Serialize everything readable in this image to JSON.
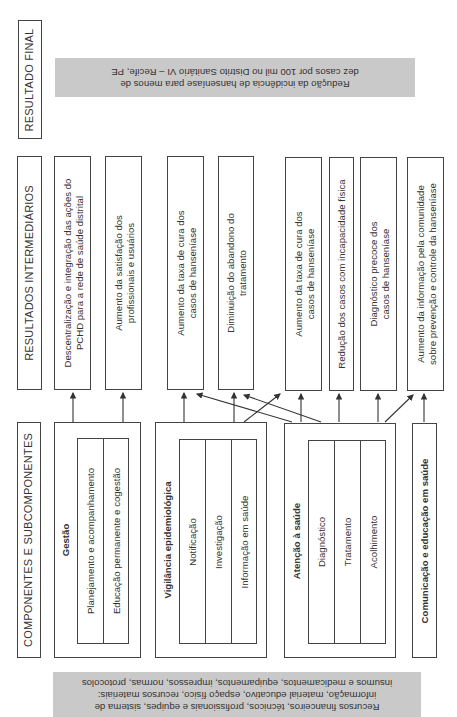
{
  "headers": {
    "final": "RESULTADO FINAL",
    "intermediate": "RESULTADOS INTERMEDIÁRIOS",
    "components": "COMPONENTES E SUBCOMPONENTES"
  },
  "final_result": {
    "line1": "Redução da incidência de hanseníase para menos de",
    "line2": "dez casos por 100 mil no Distrito Sanitário VI – Recife, PE"
  },
  "intermediate_results": [
    {
      "line1": "Descentralização e integração das ações do",
      "line2": "PCHD para a rede de saúde distrital"
    },
    {
      "line1": "Aumento da satisfação dos",
      "line2": "profissionais e usuários"
    },
    {
      "line1": "Aumento da taxa de cura dos",
      "line2": "casos de hanseníase"
    },
    {
      "line1": "Diminuição do abandono do",
      "line2": "tratamento"
    },
    {
      "line1": "Aumento da taxa de cura dos",
      "line2": "casos de hanseníase"
    },
    {
      "line1": "Redução dos casos com incapacidade física",
      "line2": ""
    },
    {
      "line1": "Diagnóstico precoce dos",
      "line2": "casos de hanseníase"
    },
    {
      "line1": "Aumento da informação pela comunidade",
      "line2": "sobre prevenção e controle da hanseníase"
    }
  ],
  "components": [
    {
      "title": "Gestão",
      "subcomponents": [
        "Planejamento e acompanhamento",
        "Educação permanente e cogestão"
      ]
    },
    {
      "title": "Vigilância epidemiológica",
      "subcomponents": [
        "Notificação",
        "Investigação",
        "Informação em saúde"
      ]
    },
    {
      "title": "Atenção à saúde",
      "subcomponents": [
        "Diagnóstico",
        "Tratamento",
        "Acolhimento"
      ]
    },
    {
      "title": "Comunicação e educação em saúde",
      "subcomponents": []
    }
  ],
  "inputs": {
    "line1": "Recursos financeiros, técnicos, profissionais e equipes, sistema de",
    "line2": "informação, material educativo, espaço físico, recursos materiais:",
    "line3": "insumos e medicamentos, equipamentos, impressos, normas, protocolos"
  },
  "colors": {
    "gray_fill": "#c9c9c9",
    "border": "#444444"
  }
}
